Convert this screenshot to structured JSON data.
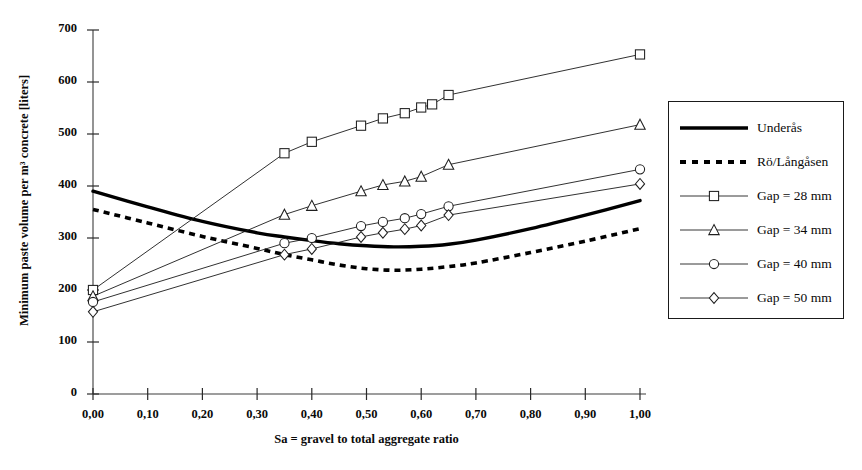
{
  "chart_data": {
    "type": "line",
    "title": "",
    "xlabel": "Sa = gravel to total aggregate ratio",
    "ylabel": "Minimum paste volume per m³ concrete [liters]",
    "xlim": [
      0,
      1
    ],
    "ylim": [
      0,
      700
    ],
    "xticks": [
      "0,00",
      "0,10",
      "0,20",
      "0,30",
      "0,40",
      "0,50",
      "0,60",
      "0,70",
      "0,80",
      "0,90",
      "1,00"
    ],
    "xtick_values": [
      0,
      0.1,
      0.2,
      0.3,
      0.4,
      0.5,
      0.6,
      0.7,
      0.8,
      0.9,
      1
    ],
    "yticks": [
      "0",
      "100",
      "200",
      "300",
      "400",
      "500",
      "600",
      "700"
    ],
    "ytick_values": [
      0,
      100,
      200,
      300,
      400,
      500,
      600,
      700
    ],
    "grid": false,
    "legend_position": "right-outside",
    "series": [
      {
        "name": "Underås",
        "marker": "none",
        "style": "thick-solid",
        "color": "#000000",
        "x": [
          0.0,
          0.1,
          0.2,
          0.3,
          0.35,
          0.4,
          0.45,
          0.5,
          0.55,
          0.6,
          0.65,
          0.7,
          0.8,
          0.9,
          1.0
        ],
        "y": [
          390,
          360,
          332,
          310,
          302,
          295,
          289,
          285,
          283,
          284,
          288,
          296,
          318,
          344,
          372
        ]
      },
      {
        "name": "Rö/Långåsen",
        "marker": "none",
        "style": "dotted",
        "color": "#000000",
        "x": [
          0.0,
          0.1,
          0.2,
          0.3,
          0.35,
          0.4,
          0.45,
          0.5,
          0.55,
          0.6,
          0.65,
          0.7,
          0.8,
          0.9,
          1.0
        ],
        "y": [
          355,
          329,
          303,
          280,
          268,
          258,
          248,
          241,
          238,
          240,
          245,
          252,
          272,
          294,
          318
        ]
      },
      {
        "name": "Gap = 28 mm",
        "marker": "square",
        "style": "thin-solid",
        "color": "#1a1a1a",
        "x": [
          0.0,
          0.35,
          0.4,
          0.49,
          0.53,
          0.57,
          0.6,
          0.62,
          0.65,
          1.0
        ],
        "y": [
          200,
          463,
          485,
          516,
          530,
          540,
          551,
          557,
          575,
          653
        ]
      },
      {
        "name": "Gap = 34 mm",
        "marker": "triangle",
        "style": "thin-solid",
        "color": "#1a1a1a",
        "x": [
          0.0,
          0.35,
          0.4,
          0.49,
          0.53,
          0.57,
          0.6,
          0.65,
          1.0
        ],
        "y": [
          188,
          345,
          362,
          390,
          402,
          409,
          418,
          441,
          518
        ]
      },
      {
        "name": "Gap = 40 mm",
        "marker": "circle",
        "style": "thin-solid",
        "color": "#1a1a1a",
        "x": [
          0.0,
          0.35,
          0.4,
          0.49,
          0.53,
          0.57,
          0.6,
          0.65,
          1.0
        ],
        "y": [
          177,
          290,
          300,
          323,
          331,
          338,
          346,
          361,
          432
        ]
      },
      {
        "name": "Gap = 50 mm",
        "marker": "diamond",
        "style": "thin-solid",
        "color": "#1a1a1a",
        "x": [
          0.0,
          0.35,
          0.4,
          0.49,
          0.53,
          0.57,
          0.6,
          0.65,
          1.0
        ],
        "y": [
          158,
          268,
          279,
          302,
          310,
          317,
          324,
          344,
          404
        ]
      }
    ]
  },
  "legend": {
    "items": [
      {
        "label": "Underås",
        "sample": "thick-solid"
      },
      {
        "label": "Rö/Långåsen",
        "sample": "dotted"
      },
      {
        "label": "Gap = 28 mm",
        "sample": "square"
      },
      {
        "label": "Gap = 34 mm",
        "sample": "triangle"
      },
      {
        "label": "Gap = 40 mm",
        "sample": "circle"
      },
      {
        "label": "Gap = 50 mm",
        "sample": "diamond"
      }
    ]
  }
}
